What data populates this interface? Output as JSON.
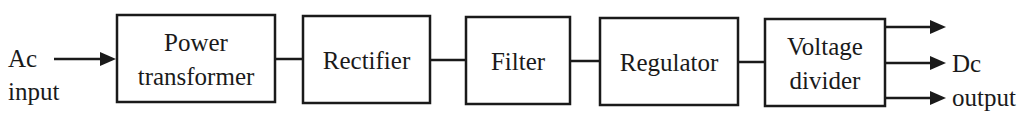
{
  "diagram": {
    "type": "block-diagram",
    "input": {
      "line1": "Ac",
      "line2": "input"
    },
    "blocks": [
      {
        "id": "power-transformer",
        "line1": "Power",
        "line2": "transformer"
      },
      {
        "id": "rectifier",
        "line1": "Rectifier"
      },
      {
        "id": "filter",
        "line1": "Filter"
      },
      {
        "id": "regulator",
        "line1": "Regulator"
      },
      {
        "id": "voltage-divider",
        "line1": "Voltage",
        "line2": "divider"
      }
    ],
    "output": {
      "line1": "Dc",
      "line2": "output",
      "arrow_count": 3
    },
    "colors": {
      "stroke": "#1a1a1a",
      "background": "#ffffff"
    }
  }
}
